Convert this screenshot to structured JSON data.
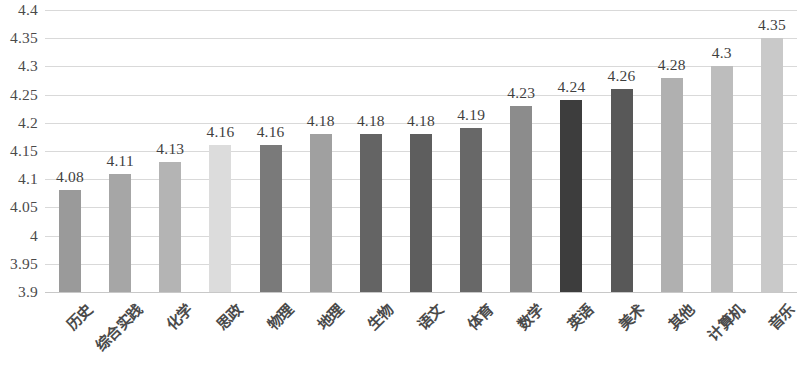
{
  "chart_data": {
    "type": "bar",
    "title": "",
    "subtitle": "",
    "xlabel": "",
    "ylabel": "",
    "categories": [
      "历史",
      "综合实践",
      "化学",
      "思政",
      "物理",
      "地理",
      "生物",
      "语文",
      "体育",
      "数学",
      "英语",
      "美术",
      "其他",
      "计算机",
      "音乐"
    ],
    "values": [
      4.08,
      4.11,
      4.13,
      4.16,
      4.16,
      4.18,
      4.18,
      4.18,
      4.19,
      4.23,
      4.24,
      4.26,
      4.28,
      4.3,
      4.35
    ],
    "data_labels": [
      "4.08",
      "4.11",
      "4.13",
      "4.16",
      "4.16",
      "4.18",
      "4.18",
      "4.18",
      "4.19",
      "4.23",
      "4.24",
      "4.26",
      "4.28",
      "4.3",
      "4.35"
    ],
    "bar_colors": [
      "#9a9a9a",
      "#a6a6a6",
      "#b4b4b4",
      "#dcdcdc",
      "#7a7a7a",
      "#a0a0a0",
      "#646464",
      "#5e5e5e",
      "#686868",
      "#8c8c8c",
      "#3d3d3d",
      "#585858",
      "#b0b0b0",
      "#bdbdbd",
      "#c9c9c9"
    ],
    "ylim": [
      3.9,
      4.4
    ],
    "ytick_labels": [
      "4.4",
      "4.35",
      "4.3",
      "4.25",
      "4.2",
      "4.15",
      "4.1",
      "4.05",
      "4",
      "3.95",
      "3.9"
    ],
    "ytick_values": [
      4.4,
      4.35,
      4.3,
      4.25,
      4.2,
      4.15,
      4.1,
      4.05,
      4.0,
      3.95,
      3.9
    ],
    "grid": true,
    "legend": false,
    "legend_position": "none",
    "grid_color": "#d9d9d9",
    "background_color": "#ffffff"
  }
}
